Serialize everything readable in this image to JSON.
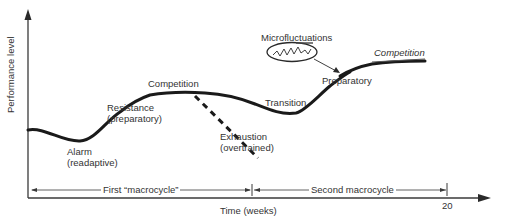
{
  "diagram": {
    "axes": {
      "y_label": "Performance level",
      "x_label": "Time (weeks)",
      "x_end_tick": "20"
    },
    "macrocycles": [
      {
        "label": "First “macrocycle”"
      },
      {
        "label": "Second macrocycle"
      }
    ],
    "phases": [
      {
        "id": "alarm",
        "line1": "Alarm",
        "line2": "(readaptive)"
      },
      {
        "id": "resistance",
        "line1": "Resistance",
        "line2": "(preparatory)"
      },
      {
        "id": "competition-1",
        "line1": "Competition"
      },
      {
        "id": "exhaustion",
        "line1": "Exhaustion",
        "line2": "(overtrained)"
      },
      {
        "id": "transition",
        "line1": "Transition"
      },
      {
        "id": "preparatory",
        "line1": "Preparatory"
      },
      {
        "id": "competition-2",
        "line1": "Competition"
      }
    ],
    "annotation": {
      "label": "Microfluctuations"
    },
    "colors": {
      "curve": "#1a1a1a",
      "axis": "#3a3a3a",
      "text": "#333333",
      "background": "#ffffff"
    }
  }
}
